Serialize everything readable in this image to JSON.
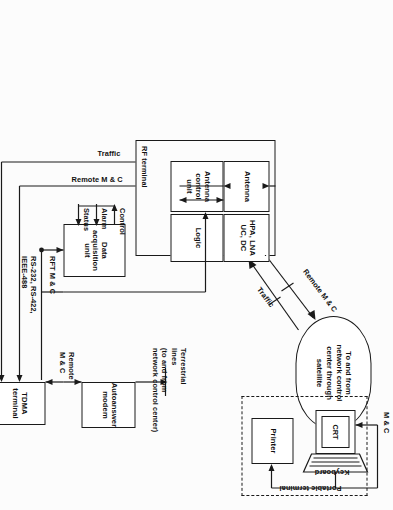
{
  "figure": {
    "type": "block-diagram",
    "orientation_deg": 90
  },
  "cloud": {
    "name": "satellite-link-cloud",
    "text": "To and from\nnetwork control\ncenter through\nsatellite"
  },
  "link_labels": {
    "remote_mc": "Remote M & C",
    "traffic": "Traffic"
  },
  "rf_terminal": {
    "title": "RF terminal",
    "blocks": [
      {
        "id": "antenna",
        "label": "Antenna"
      },
      {
        "id": "antenna-control-unit",
        "label": "Antenna\ncontrol\nunit"
      },
      {
        "id": "hpa-lna",
        "label": "HPA, LNA\nUC, DC"
      },
      {
        "id": "logic",
        "label": "Logic"
      }
    ]
  },
  "data_acquisition": {
    "label": "Data\nacquisition\nunit",
    "signals": [
      {
        "id": "control",
        "label": "Control"
      },
      {
        "id": "alarm",
        "label": "Alarm"
      },
      {
        "id": "status",
        "label": "Status"
      }
    ]
  },
  "tdma": {
    "label": "TDMA\nterminal",
    "bus_label": "RFT M & C",
    "bus_standards": "RS-232, RS-422,\nIEEE-488",
    "traffic_label": "Traffic",
    "remote_mc_label": "Remote M & C",
    "modem_link_label": "Remote\nM & C",
    "terminal_link_label": "M & C"
  },
  "modem": {
    "label": "Autoanswer\nmodem",
    "terrestrial": "Terrestrial\nlines\n(to and from\nnetwork control center)"
  },
  "portable_terminal": {
    "label": "Portable terminal",
    "crt": "CRT",
    "keyboard": "Keyboard",
    "printer": "Printer"
  },
  "colors": {
    "ink": "#1a1a1a",
    "paper": "#ffffff",
    "page": "#fcfcfc"
  }
}
